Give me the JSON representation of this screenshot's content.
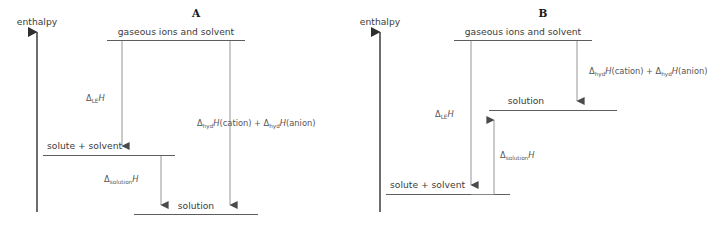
{
  "figure": {
    "axis_label": "enthalpy",
    "panels": [
      {
        "id": "A",
        "title": "A",
        "levels": {
          "top": "gaseous ions and solvent",
          "middle": "solute + solvent",
          "bottom": "solution"
        },
        "arrows": {
          "lattice": {
            "delta": "Δ",
            "sub": "LE",
            "symbol": "H",
            "direction": "down"
          },
          "hydration": {
            "delta": "Δ",
            "sub": "hyd",
            "symbol": "H",
            "species_1": "(cation)",
            "plus": "+",
            "species_2": "(anion)",
            "direction": "down"
          },
          "solution": {
            "delta": "Δ",
            "sub": "solution",
            "symbol": "H",
            "direction": "down"
          }
        }
      },
      {
        "id": "B",
        "title": "B",
        "levels": {
          "top": "gaseous ions and solvent",
          "middle": "solution",
          "bottom": "solute + solvent"
        },
        "arrows": {
          "lattice": {
            "delta": "Δ",
            "sub": "LE",
            "symbol": "H",
            "direction": "down"
          },
          "hydration": {
            "delta": "Δ",
            "sub": "hyd",
            "symbol": "H",
            "species_1": "(cation)",
            "plus": "+",
            "species_2": "(anion)",
            "direction": "down"
          },
          "solution": {
            "delta": "Δ",
            "sub": "solution",
            "symbol": "H",
            "direction": "up"
          }
        }
      }
    ],
    "colors": {
      "level_line": "#5d5d5d",
      "arrow_line": "#8a8a8a",
      "axis": "#2f2f2f",
      "text": "#3b3b3b",
      "background": "#ffffff"
    }
  }
}
